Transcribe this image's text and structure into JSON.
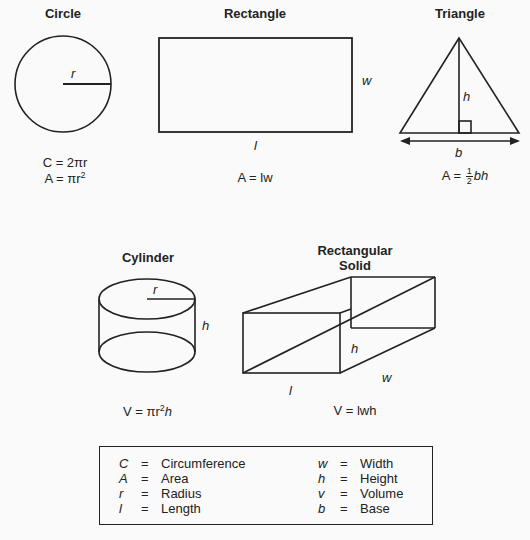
{
  "shapes": {
    "circle": {
      "title": "Circle",
      "radius_label": "r",
      "formula_1": "C = 2πr",
      "formula_2_prefix": "A = πr",
      "formula_2_sup": "2"
    },
    "rectangle": {
      "title": "Rectangle",
      "width_label": "w",
      "length_label": "l",
      "formula": "A = lw"
    },
    "triangle": {
      "title": "Triangle",
      "height_label": "h",
      "base_label": "b",
      "formula_prefix": "A = ",
      "frac_num": "1",
      "frac_den": "2",
      "formula_suffix": "bh"
    },
    "cylinder": {
      "title": "Cylinder",
      "radius_label": "r",
      "height_label": "h",
      "formula_prefix": "V = πr",
      "formula_sup": "2",
      "formula_suffix": "h"
    },
    "rectangular_solid": {
      "title_line_1": "Rectangular",
      "title_line_2": "Solid",
      "height_label": "h",
      "length_label": "l",
      "width_label": "w",
      "formula": "V = lwh"
    }
  },
  "legend": {
    "left": [
      {
        "symbol": "C",
        "eq": "=",
        "word": "Circumference"
      },
      {
        "symbol": "A",
        "eq": "=",
        "word": "Area"
      },
      {
        "symbol": "r",
        "eq": "=",
        "word": "Radius"
      },
      {
        "symbol": "l",
        "eq": "=",
        "word": "Length"
      }
    ],
    "right": [
      {
        "symbol": "w",
        "eq": "=",
        "word": "Width"
      },
      {
        "symbol": "h",
        "eq": "=",
        "word": "Height"
      },
      {
        "symbol": "v",
        "eq": "=",
        "word": "Volume"
      },
      {
        "symbol": "b",
        "eq": "=",
        "word": "Base"
      }
    ]
  },
  "colors": {
    "stroke": "#222222",
    "background": "#fafafa"
  }
}
